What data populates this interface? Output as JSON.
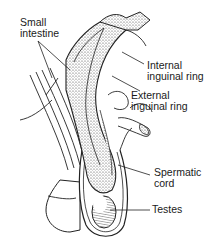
{
  "diagram": {
    "labels": [
      {
        "id": "small-intestine",
        "lines": [
          "Small",
          "intestine"
        ]
      },
      {
        "id": "internal-inguinal-ring",
        "lines": [
          "Internal",
          "inguinal ring"
        ]
      },
      {
        "id": "external-inguinal-ring",
        "lines": [
          "External",
          "inguinal ring"
        ]
      },
      {
        "id": "spermatic-cord",
        "lines": [
          "Spermatic",
          "cord"
        ]
      },
      {
        "id": "testes",
        "lines": [
          "Testes"
        ]
      }
    ],
    "colors": {
      "ink": "#1a1a1a",
      "background": "#ffffff",
      "shade": "#8a8a8a"
    }
  }
}
